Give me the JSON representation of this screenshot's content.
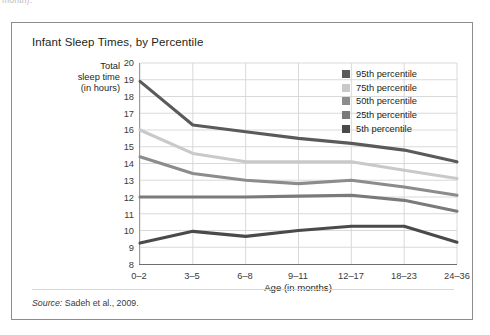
{
  "clipped_top_text": "month).",
  "figure": {
    "title": "Infant Sleep Times, by Percentile",
    "source_prefix": "Source:",
    "source_text": " Sadeh et al., 2009."
  },
  "axes": {
    "y_title_lines": [
      "Total",
      "sleep time",
      "(in hours)"
    ],
    "x_title": "Age (in months)"
  },
  "legend": {
    "position": "top-right",
    "items": [
      {
        "label": "95th percentile",
        "color": "#5a5a5a"
      },
      {
        "label": "75th percentile",
        "color": "#c9c9c9"
      },
      {
        "label": "50th percentile",
        "color": "#8c8c8c"
      },
      {
        "label": "25th percentile",
        "color": "#7a7a7a"
      },
      {
        "label": "5th percentile",
        "color": "#4a4a4a"
      }
    ]
  },
  "chart_data": {
    "type": "line",
    "title": "Infant Sleep Times, by Percentile",
    "xlabel": "Age (in months)",
    "ylabel": "Total sleep time (in hours)",
    "categories": [
      "0–2",
      "3–5",
      "6–8",
      "9–11",
      "12–17",
      "18–23",
      "24–36"
    ],
    "ylim": [
      8,
      20
    ],
    "yticks": [
      8,
      9,
      10,
      11,
      12,
      13,
      14,
      15,
      16,
      17,
      18,
      19,
      20
    ],
    "grid": "both",
    "legend_position": "top-right",
    "series": [
      {
        "name": "95th percentile",
        "color": "#5a5a5a",
        "values": [
          18.9,
          16.3,
          15.9,
          15.5,
          15.2,
          14.8,
          14.1
        ]
      },
      {
        "name": "75th percentile",
        "color": "#c9c9c9",
        "values": [
          16.0,
          14.6,
          14.1,
          14.1,
          14.1,
          13.6,
          13.1
        ]
      },
      {
        "name": "50th percentile",
        "color": "#8c8c8c",
        "values": [
          14.4,
          13.4,
          13.0,
          12.8,
          13.0,
          12.6,
          12.1
        ]
      },
      {
        "name": "25th percentile",
        "color": "#7a7a7a",
        "values": [
          12.0,
          12.0,
          12.0,
          12.05,
          12.1,
          11.8,
          11.15
        ]
      },
      {
        "name": "5th percentile",
        "color": "#4a4a4a",
        "values": [
          9.25,
          9.95,
          9.65,
          10.0,
          10.25,
          10.25,
          9.3
        ]
      }
    ]
  }
}
